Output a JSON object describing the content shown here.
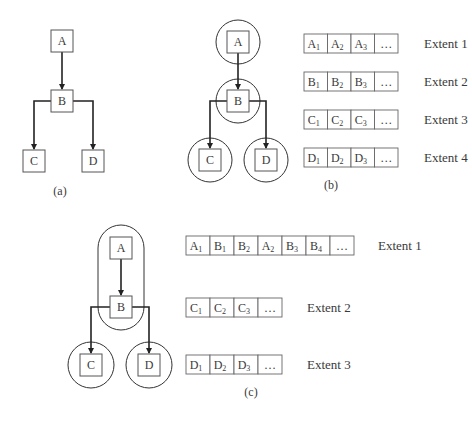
{
  "panels": {
    "a": {
      "caption": "(a)",
      "nodes": [
        {
          "id": "A",
          "label": "A",
          "x": 51,
          "y": 30
        },
        {
          "id": "B",
          "label": "B",
          "x": 51,
          "y": 90
        },
        {
          "id": "C",
          "label": "C",
          "x": 23,
          "y": 150
        },
        {
          "id": "D",
          "label": "D",
          "x": 82,
          "y": 150
        }
      ]
    },
    "b": {
      "caption": "(b)",
      "nodes": [
        {
          "id": "A",
          "label": "A",
          "x": 227,
          "y": 31
        },
        {
          "id": "B",
          "label": "B",
          "x": 227,
          "y": 90
        },
        {
          "id": "C",
          "label": "C",
          "x": 199,
          "y": 149
        },
        {
          "id": "D",
          "label": "D",
          "x": 255,
          "y": 149
        }
      ],
      "extents": [
        {
          "label": "Extent 1",
          "cells": [
            {
              "b": "A",
              "s": "1"
            },
            {
              "b": "A",
              "s": "2"
            },
            {
              "b": "A",
              "s": "3"
            },
            {
              "b": "…",
              "s": ""
            }
          ]
        },
        {
          "label": "Extent 2",
          "cells": [
            {
              "b": "B",
              "s": "1"
            },
            {
              "b": "B",
              "s": "2"
            },
            {
              "b": "B",
              "s": "3"
            },
            {
              "b": "…",
              "s": ""
            }
          ]
        },
        {
          "label": "Extent 3",
          "cells": [
            {
              "b": "C",
              "s": "1"
            },
            {
              "b": "C",
              "s": "2"
            },
            {
              "b": "C",
              "s": "3"
            },
            {
              "b": "…",
              "s": ""
            }
          ]
        },
        {
          "label": "Extent 4",
          "cells": [
            {
              "b": "D",
              "s": "1"
            },
            {
              "b": "D",
              "s": "2"
            },
            {
              "b": "D",
              "s": "3"
            },
            {
              "b": "…",
              "s": ""
            }
          ]
        }
      ]
    },
    "c": {
      "caption": "(c)",
      "nodes": [
        {
          "id": "A",
          "label": "A",
          "x": 110,
          "y": 237
        },
        {
          "id": "B",
          "label": "B",
          "x": 110,
          "y": 296
        },
        {
          "id": "C",
          "label": "C",
          "x": 80,
          "y": 354
        },
        {
          "id": "D",
          "label": "D",
          "x": 138,
          "y": 354
        }
      ],
      "extents": [
        {
          "label": "Extent 1",
          "cells": [
            {
              "b": "A",
              "s": "1"
            },
            {
              "b": "B",
              "s": "1"
            },
            {
              "b": "B",
              "s": "2"
            },
            {
              "b": "A",
              "s": "2"
            },
            {
              "b": "B",
              "s": "3"
            },
            {
              "b": "B",
              "s": "4"
            },
            {
              "b": "…",
              "s": ""
            }
          ]
        },
        {
          "label": "Extent 2",
          "cells": [
            {
              "b": "C",
              "s": "1"
            },
            {
              "b": "C",
              "s": "2"
            },
            {
              "b": "C",
              "s": "3"
            },
            {
              "b": "…",
              "s": ""
            }
          ]
        },
        {
          "label": "Extent 3",
          "cells": [
            {
              "b": "D",
              "s": "1"
            },
            {
              "b": "D",
              "s": "2"
            },
            {
              "b": "D",
              "s": "3"
            },
            {
              "b": "…",
              "s": ""
            }
          ]
        }
      ]
    }
  }
}
